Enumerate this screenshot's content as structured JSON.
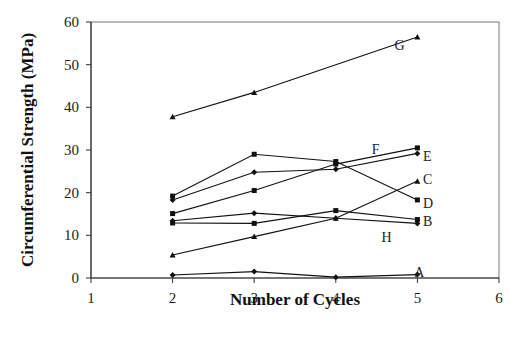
{
  "chart_data": {
    "type": "line",
    "title": "",
    "xlabel": "Number of Cycles",
    "ylabel": "Circumferential Strength (MPa)",
    "xlim": [
      1,
      6
    ],
    "ylim": [
      0,
      60
    ],
    "xticks": [
      1,
      2,
      3,
      4,
      5,
      6
    ],
    "yticks": [
      0,
      10,
      20,
      30,
      40,
      50,
      60
    ],
    "grid": false,
    "legend": "inline labels at series ends",
    "series": [
      {
        "name": "A",
        "marker": "diamond",
        "x": [
          2,
          3,
          4,
          5
        ],
        "values": [
          0.7,
          1.5,
          0.2,
          0.8
        ]
      },
      {
        "name": "B",
        "marker": "square",
        "x": [
          2,
          3,
          4,
          5
        ],
        "values": [
          12.9,
          12.8,
          15.8,
          13.7
        ]
      },
      {
        "name": "C",
        "marker": "triangle",
        "x": [
          2,
          3,
          4,
          5
        ],
        "values": [
          5.4,
          9.7,
          14.0,
          22.7
        ]
      },
      {
        "name": "D",
        "marker": "square",
        "x": [
          2,
          3,
          4,
          5
        ],
        "values": [
          19.2,
          29.0,
          27.3,
          18.3
        ]
      },
      {
        "name": "E",
        "marker": "diamond",
        "x": [
          2,
          3,
          4,
          5
        ],
        "values": [
          18.3,
          24.8,
          25.5,
          29.2
        ]
      },
      {
        "name": "F",
        "marker": "square",
        "x": [
          2,
          3,
          4,
          5
        ],
        "values": [
          15.1,
          20.5,
          26.7,
          30.5
        ]
      },
      {
        "name": "G",
        "marker": "triangle",
        "x": [
          2,
          3,
          5
        ],
        "values": [
          37.8,
          43.5,
          56.5
        ]
      },
      {
        "name": "H",
        "marker": "diamond",
        "x": [
          2,
          3,
          4,
          5
        ],
        "values": [
          13.4,
          15.2,
          14.0,
          12.8
        ]
      }
    ],
    "annotations": [
      {
        "text": "G",
        "x": 4.72,
        "y": 54.5
      },
      {
        "text": "F",
        "x": 4.44,
        "y": 30.2
      },
      {
        "text": "E",
        "x": 5.07,
        "y": 28.7
      },
      {
        "text": "C",
        "x": 5.07,
        "y": 23.2
      },
      {
        "text": "D",
        "x": 5.07,
        "y": 17.5
      },
      {
        "text": "B",
        "x": 5.07,
        "y": 13.3
      },
      {
        "text": "H",
        "x": 4.56,
        "y": 9.5
      },
      {
        "text": "A",
        "x": 4.96,
        "y": 1.5
      }
    ]
  }
}
